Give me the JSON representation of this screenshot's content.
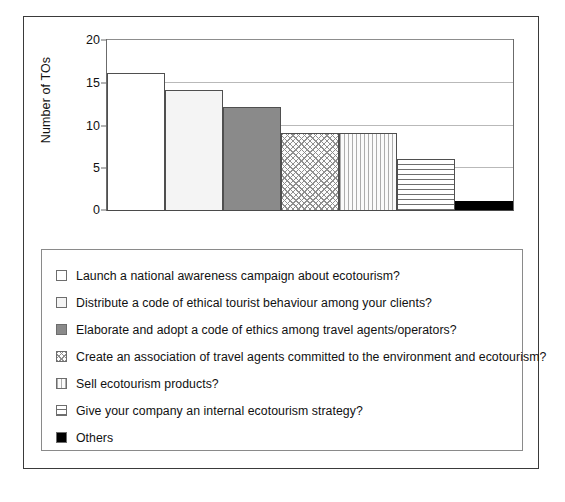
{
  "chart_data": {
    "type": "bar",
    "title": "",
    "xlabel": "",
    "ylabel": "Number of TOs",
    "ylim": [
      0,
      20
    ],
    "yticks": [
      "0",
      "5",
      "10",
      "15",
      "20"
    ],
    "grid": true,
    "legend_position": "below",
    "categories": [
      "Launch a national awareness campaign about ecotourism?",
      "Distribute a code of ethical tourist behaviour among your clients?",
      "Elaborate and adopt a code of ethics among travel agents/operators?",
      "Create an association of travel agents committed to the environment and ecotourism?",
      "Sell ecotourism products?",
      "Give your company an internal ecotourism strategy?",
      "Others"
    ],
    "values": [
      16,
      14,
      12,
      9,
      9,
      6,
      1
    ],
    "patterns": [
      "solid-white",
      "solid-offwhite",
      "solid-dark-gray",
      "diagonal-crosshatch",
      "vertical-lines",
      "horizontal-lines",
      "solid-black"
    ]
  },
  "legend": {
    "items": [
      {
        "label": "Launch a national awareness campaign about ecotourism?",
        "pattern": "solid-white"
      },
      {
        "label": "Distribute a code of ethical tourist behaviour among your clients?",
        "pattern": "solid-offwhite"
      },
      {
        "label": "Elaborate and adopt a code of ethics among travel agents/operators?",
        "pattern": "solid-dark-gray"
      },
      {
        "label": "Create an association of travel agents committed to the environment and ecotourism?",
        "pattern": "diagonal-crosshatch"
      },
      {
        "label": "Sell ecotourism products?",
        "pattern": "vertical-lines"
      },
      {
        "label": "Give your company an internal ecotourism strategy?",
        "pattern": "horizontal-lines"
      },
      {
        "label": "Others",
        "pattern": "solid-black"
      }
    ]
  },
  "colors": {
    "frame": "#3a3a3a",
    "axis": "#6b6b6b",
    "gridline": "#b9b9b9",
    "bar_outline": "#4f4f4f",
    "dark_gray_fill": "#8a8a8a",
    "black_fill": "#000000"
  }
}
